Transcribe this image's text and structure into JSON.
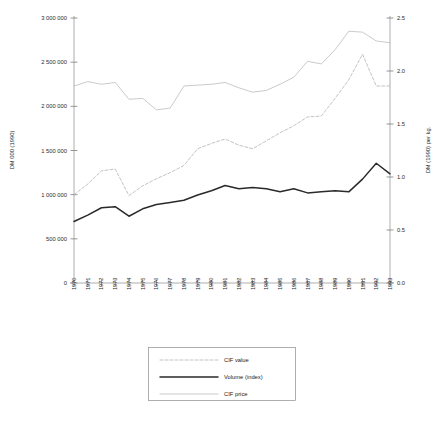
{
  "title": "",
  "chart_data": {
    "type": "line",
    "title": "",
    "xlabel": "",
    "ylabel": "DM 000 (1990)",
    "y2label": "DM (1990) per kg.",
    "categories": [
      "1970",
      "1971",
      "1972",
      "1973",
      "1974",
      "1975",
      "1976",
      "1977",
      "1978",
      "1979",
      "1980",
      "1981",
      "1982",
      "1983",
      "1984",
      "1985",
      "1986",
      "1987",
      "1988",
      "1989",
      "1990",
      "1991",
      "1992",
      "1993"
    ],
    "ylim": [
      0,
      3000000
    ],
    "yticks": [
      "0",
      "500 000",
      "1 000 000",
      "1 500 000",
      "2 000 000",
      "2 500 000",
      "3 000 000"
    ],
    "ytick_values": [
      0,
      500000,
      1000000,
      1500000,
      2000000,
      2500000,
      3000000
    ],
    "y2lim": [
      0,
      2.5
    ],
    "y2ticks": [
      "0.0",
      "0.5",
      "1.0",
      "1.5",
      "2.0",
      "2.5"
    ],
    "y2tick_values": [
      0,
      0.5,
      1.0,
      1.5,
      2.0,
      2.5
    ],
    "grid": false,
    "legend_position": "bottom-center",
    "series": [
      {
        "name": "CIF value",
        "axis": "left",
        "style": "dashed",
        "color": "#b4b4b4",
        "width": 0.8,
        "values": [
          1000000,
          1120000,
          1270000,
          1290000,
          990000,
          1100000,
          1180000,
          1250000,
          1330000,
          1520000,
          1580000,
          1630000,
          1560000,
          1520000,
          1610000,
          1700000,
          1780000,
          1880000,
          1890000,
          2090000,
          2300000,
          2590000,
          2230000,
          2230000
        ]
      },
      {
        "name": "Volume (index)",
        "axis": "right",
        "style": "solid-thick",
        "color": "#2a2a2a",
        "width": 1.5,
        "values": [
          0.58,
          0.64,
          0.71,
          0.72,
          0.63,
          0.7,
          0.74,
          0.76,
          0.78,
          0.83,
          0.87,
          0.92,
          0.89,
          0.9,
          0.89,
          0.86,
          0.89,
          0.85,
          0.86,
          0.87,
          0.86,
          0.98,
          1.13,
          1.03
        ]
      },
      {
        "name": "CIF price",
        "axis": "left",
        "style": "solid-thin",
        "color": "#bdbdbd",
        "width": 0.8,
        "values": [
          2230000,
          2280000,
          2250000,
          2270000,
          2080000,
          2090000,
          1960000,
          1980000,
          2230000,
          2240000,
          2250000,
          2270000,
          2210000,
          2160000,
          2180000,
          2250000,
          2330000,
          2510000,
          2480000,
          2640000,
          2850000,
          2840000,
          2740000,
          2720000
        ]
      }
    ]
  },
  "legend": {
    "items": [
      {
        "label": "CIF value"
      },
      {
        "label": "Volume (index)"
      },
      {
        "label": "CIF price"
      }
    ]
  }
}
